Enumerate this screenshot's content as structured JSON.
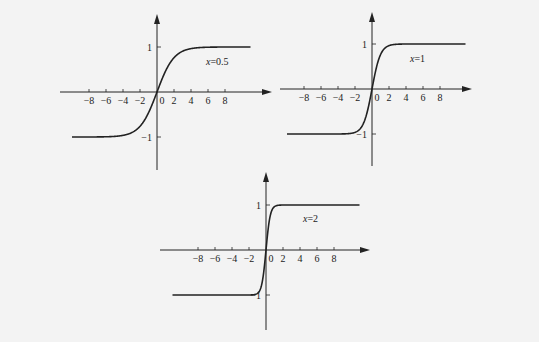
{
  "colors": {
    "background": "#f3f3f3",
    "ink": "#222222"
  },
  "chart_data": [
    {
      "type": "line",
      "title": "",
      "annotation": "x=0.5",
      "function": "y = tanh(0.5 t)",
      "k": 0.5,
      "xlabel": "",
      "ylabel": "",
      "x_ticks": [
        "-8",
        "-6",
        "-4",
        "-2",
        "0",
        "2",
        "4",
        "6",
        "8"
      ],
      "y_ticks": [
        "1",
        "-1"
      ],
      "xlim": [
        -10,
        11
      ],
      "ylim": [
        -1.7,
        1.7
      ],
      "grid": false,
      "series": [
        {
          "name": "x=0.5",
          "x": [
            -10,
            -8,
            -6,
            -4,
            -2,
            -1,
            0,
            1,
            2,
            4,
            6,
            8,
            11
          ],
          "values": [
            -1.0,
            -0.96,
            -0.91,
            -0.76,
            -0.46,
            -0.24,
            0,
            0.24,
            0.46,
            0.76,
            0.91,
            0.96,
            0.99
          ]
        }
      ],
      "layout": {
        "origin": [
          157,
          92
        ],
        "sx": 8.5,
        "sy": 45,
        "axis_x": [
          60,
          272
        ],
        "axis_y": [
          170,
          14
        ],
        "label_pos": [
          206,
          65
        ]
      }
    },
    {
      "type": "line",
      "title": "",
      "annotation": "x=1",
      "function": "y = tanh(t)",
      "k": 1,
      "xlabel": "",
      "ylabel": "",
      "x_ticks": [
        "-8",
        "-6",
        "-4",
        "-2",
        "0",
        "2",
        "4",
        "6",
        "8"
      ],
      "y_ticks": [
        "1",
        "-1"
      ],
      "xlim": [
        -10,
        11
      ],
      "ylim": [
        -1.7,
        1.7
      ],
      "grid": false,
      "series": [
        {
          "name": "x=1",
          "x": [
            -10,
            -8,
            -6,
            -4,
            -2,
            -1,
            0,
            1,
            2,
            4,
            6,
            8,
            10
          ],
          "values": [
            -1.0,
            -1.0,
            -1.0,
            -1.0,
            -0.96,
            -0.76,
            0,
            0.76,
            0.96,
            1.0,
            1.0,
            1.0,
            1.0
          ]
        }
      ],
      "layout": {
        "origin": [
          372,
          89
        ],
        "sx": 8.5,
        "sy": 45,
        "axis_x": [
          280,
          472
        ],
        "axis_y": [
          166,
          12
        ],
        "label_pos": [
          410,
          62
        ]
      }
    },
    {
      "type": "line",
      "title": "",
      "annotation": "x=2",
      "function": "y = tanh(2 t)",
      "k": 2,
      "xlabel": "",
      "ylabel": "",
      "x_ticks": [
        "-8",
        "-6",
        "-4",
        "-2",
        "0",
        "2",
        "4",
        "6",
        "8"
      ],
      "y_ticks": [
        "1",
        "-1"
      ],
      "xlim": [
        -11,
        11
      ],
      "ylim": [
        -1.7,
        1.7
      ],
      "grid": false,
      "series": [
        {
          "name": "x=2",
          "x": [
            -11,
            -8,
            -6,
            -4,
            -2,
            -1,
            -0.5,
            0,
            0.5,
            1,
            2,
            4,
            6,
            8,
            11
          ],
          "values": [
            -1.0,
            -1.0,
            -1.0,
            -1.0,
            -1.0,
            -0.96,
            -0.76,
            0,
            0.76,
            0.96,
            1.0,
            1.0,
            1.0,
            1.0,
            1.0
          ]
        }
      ],
      "layout": {
        "origin": [
          266,
          250
        ],
        "sx": 8.5,
        "sy": 45,
        "axis_x": [
          160,
          370
        ],
        "axis_y": [
          330,
          172
        ],
        "label_pos": [
          303,
          222
        ]
      }
    }
  ]
}
